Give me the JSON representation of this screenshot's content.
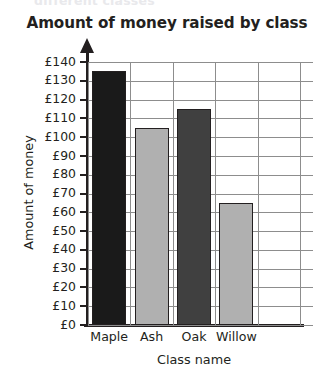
{
  "caption_cutoff": "different classes",
  "chart_data": {
    "type": "bar",
    "title": "Amount of money raised by class",
    "xlabel": "Class name",
    "ylabel": "Amount of money",
    "categories": [
      "Maple",
      "Ash",
      "Oak",
      "Willow"
    ],
    "values": [
      135,
      105,
      115,
      65
    ],
    "bar_colors": [
      "#1a1a1a",
      "#b0b0b0",
      "#404040",
      "#b0b0b0"
    ],
    "ylim": [
      0,
      140
    ],
    "ytick_step": 10,
    "ytick_labels": [
      "£0",
      "£10",
      "£20",
      "£30",
      "£40",
      "£50",
      "£60",
      "£70",
      "£80",
      "£90",
      "£100",
      "£110",
      "£120",
      "£130",
      "£140"
    ],
    "currency_symbol": "£",
    "grid": true,
    "legend": "none"
  }
}
